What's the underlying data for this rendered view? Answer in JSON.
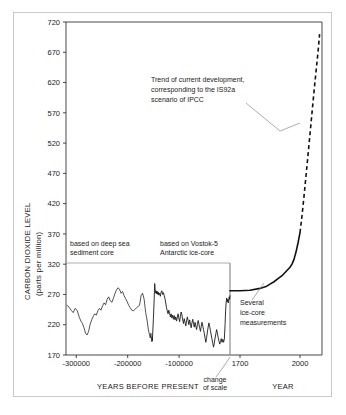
{
  "chart_data": {
    "type": "line",
    "title": "",
    "ylabel_line1": "CARBON DIOXIDE LEVEL",
    "ylabel_line2": "(parts per million)",
    "ylim": [
      170,
      720
    ],
    "yticks": [
      170,
      220,
      270,
      320,
      370,
      420,
      470,
      520,
      570,
      620,
      670,
      720
    ],
    "ytick_labels": [
      "170",
      "220",
      "270",
      "320",
      "370",
      "420",
      "470",
      "520",
      "570",
      "620",
      "670",
      "720"
    ],
    "grid": false,
    "legend": "none",
    "panels": [
      {
        "name": "paleo-panel",
        "xlabel": "YEARS BEFORE PRESENT",
        "xlim": [
          -320000,
          -1000
        ],
        "xticks": [
          -300000,
          -200000,
          -100000
        ],
        "xtick_labels": [
          "-300000",
          "-200000",
          "-100000"
        ],
        "series": [
          {
            "name": "deep-sea-sediment-core",
            "source_label_line1": "based on deep sea",
            "source_label_line2": "sediment core",
            "x_range": [
              -320000,
              -152000
            ],
            "style": "solid",
            "points": [
              [
                -318000,
                252
              ],
              [
                -314000,
                249
              ],
              [
                -310000,
                244
              ],
              [
                -306000,
                240
              ],
              [
                -302000,
                247
              ],
              [
                -298000,
                243
              ],
              [
                -294000,
                232
              ],
              [
                -291000,
                226
              ],
              [
                -288000,
                222
              ],
              [
                -285000,
                215
              ],
              [
                -282000,
                206
              ],
              [
                -279000,
                203
              ],
              [
                -276000,
                209
              ],
              [
                -273000,
                221
              ],
              [
                -270000,
                228
              ],
              [
                -267000,
                234
              ],
              [
                -264000,
                238
              ],
              [
                -261000,
                236
              ],
              [
                -258000,
                243
              ],
              [
                -255000,
                247
              ],
              [
                -252000,
                244
              ],
              [
                -249000,
                251
              ],
              [
                -246000,
                256
              ],
              [
                -243000,
                253
              ],
              [
                -240000,
                262
              ],
              [
                -237000,
                266
              ],
              [
                -234000,
                260
              ],
              [
                -231000,
                257
              ],
              [
                -228000,
                263
              ],
              [
                -225000,
                271
              ],
              [
                -222000,
                277
              ],
              [
                -219000,
                281
              ],
              [
                -216000,
                279
              ],
              [
                -213000,
                272
              ],
              [
                -210000,
                275
              ],
              [
                -207000,
                268
              ],
              [
                -204000,
                263
              ],
              [
                -201000,
                258
              ],
              [
                -198000,
                252
              ],
              [
                -195000,
                248
              ],
              [
                -192000,
                244
              ],
              [
                -189000,
                243
              ],
              [
                -186000,
                245
              ],
              [
                -183000,
                248
              ],
              [
                -180000,
                250
              ],
              [
                -177000,
                252
              ],
              [
                -174000,
                268
              ],
              [
                -171000,
                272
              ],
              [
                -168000,
                262
              ],
              [
                -165000,
                240
              ],
              [
                -162000,
                226
              ],
              [
                -160000,
                213
              ],
              [
                -158000,
                205
              ],
              [
                -156000,
                198
              ],
              [
                -155000,
                206
              ],
              [
                -154000,
                199
              ],
              [
                -153000,
                192
              ],
              [
                -152500,
                200
              ],
              [
                -152000,
                194
              ]
            ]
          },
          {
            "name": "vostok-5-antarctic-ice-core",
            "source_label_line1": "based on Vostok-5",
            "source_label_line2": "Antarctic ice-core",
            "x_range": [
              -152000,
              -1000
            ],
            "style": "solid",
            "points": [
              [
                -152000,
                194
              ],
              [
                -150000,
                230
              ],
              [
                -148500,
                262
              ],
              [
                -147500,
                288
              ],
              [
                -146500,
                278
              ],
              [
                -145500,
                272
              ],
              [
                -144500,
                276
              ],
              [
                -143500,
                271
              ],
              [
                -142500,
                275
              ],
              [
                -141500,
                270
              ],
              [
                -140500,
                274
              ],
              [
                -139500,
                269
              ],
              [
                -138000,
                272
              ],
              [
                -136500,
                267
              ],
              [
                -135000,
                274
              ],
              [
                -133500,
                276
              ],
              [
                -132000,
                270
              ],
              [
                -130500,
                273
              ],
              [
                -129000,
                268
              ],
              [
                -127500,
                263
              ],
              [
                -126000,
                256
              ],
              [
                -124500,
                248
              ],
              [
                -123000,
                243
              ],
              [
                -121500,
                238
              ],
              [
                -120000,
                244
              ],
              [
                -118500,
                239
              ],
              [
                -117000,
                233
              ],
              [
                -115500,
                238
              ],
              [
                -114000,
                231
              ],
              [
                -112500,
                236
              ],
              [
                -111000,
                229
              ],
              [
                -109500,
                235
              ],
              [
                -108000,
                228
              ],
              [
                -106500,
                233
              ],
              [
                -105000,
                226
              ],
              [
                -103500,
                232
              ],
              [
                -102000,
                238
              ],
              [
                -100500,
                231
              ],
              [
                -99000,
                225
              ],
              [
                -97500,
                234
              ],
              [
                -96000,
                241
              ],
              [
                -94500,
                236
              ],
              [
                -93000,
                228
              ],
              [
                -91500,
                222
              ],
              [
                -90000,
                230
              ],
              [
                -88500,
                224
              ],
              [
                -87000,
                218
              ],
              [
                -85500,
                226
              ],
              [
                -84000,
                233
              ],
              [
                -82500,
                227
              ],
              [
                -81000,
                220
              ],
              [
                -79500,
                228
              ],
              [
                -78000,
                221
              ],
              [
                -76500,
                215
              ],
              [
                -75000,
                223
              ],
              [
                -73500,
                229
              ],
              [
                -72000,
                222
              ],
              [
                -70500,
                216
              ],
              [
                -69000,
                224
              ],
              [
                -67500,
                218
              ],
              [
                -66000,
                212
              ],
              [
                -64500,
                220
              ],
              [
                -63000,
                227
              ],
              [
                -61500,
                221
              ],
              [
                -60000,
                215
              ],
              [
                -58500,
                209
              ],
              [
                -57000,
                217
              ],
              [
                -55500,
                224
              ],
              [
                -54000,
                218
              ],
              [
                -52500,
                212
              ],
              [
                -51000,
                206
              ],
              [
                -49500,
                198
              ],
              [
                -48000,
                191
              ],
              [
                -46500,
                199
              ],
              [
                -45000,
                208
              ],
              [
                -43500,
                216
              ],
              [
                -42000,
                223
              ],
              [
                -40500,
                217
              ],
              [
                -39000,
                210
              ],
              [
                -37500,
                203
              ],
              [
                -36000,
                196
              ],
              [
                -34500,
                189
              ],
              [
                -33000,
                183
              ],
              [
                -31500,
                190
              ],
              [
                -30000,
                198
              ],
              [
                -28500,
                205
              ],
              [
                -27000,
                212
              ],
              [
                -25500,
                206
              ],
              [
                -24000,
                199
              ],
              [
                -22500,
                193
              ],
              [
                -21000,
                188
              ],
              [
                -19500,
                192
              ],
              [
                -18000,
                197
              ],
              [
                -16500,
                191
              ],
              [
                -15000,
                196
              ],
              [
                -13500,
                191
              ],
              [
                -12000,
                196
              ],
              [
                -10500,
                222
              ],
              [
                -9500,
                244
              ],
              [
                -8500,
                256
              ],
              [
                -7500,
                264
              ],
              [
                -6500,
                258
              ],
              [
                -5500,
                262
              ],
              [
                -4500,
                256
              ],
              [
                -3500,
                261
              ],
              [
                -2500,
                266
              ],
              [
                -1800,
                262
              ],
              [
                -1000,
                268
              ]
            ]
          }
        ]
      },
      {
        "name": "modern-panel",
        "xlabel": "YEAR",
        "xlim": [
          1650,
          2110
        ],
        "xticks": [
          1700,
          2000
        ],
        "xtick_labels": [
          "1700",
          "2000"
        ],
        "series": [
          {
            "name": "instrumental-and-icecore-record",
            "style": "solid",
            "annotation_line1": "Several",
            "annotation_line2": "ice-core",
            "annotation_line3": "measurements",
            "points": [
              [
                1650,
                276
              ],
              [
                1700,
                276
              ],
              [
                1750,
                277
              ],
              [
                1800,
                280
              ],
              [
                1830,
                283
              ],
              [
                1850,
                287
              ],
              [
                1870,
                291
              ],
              [
                1890,
                296
              ],
              [
                1910,
                301
              ],
              [
                1930,
                308
              ],
              [
                1950,
                315
              ],
              [
                1960,
                320
              ],
              [
                1970,
                328
              ],
              [
                1980,
                340
              ],
              [
                1990,
                355
              ],
              [
                2000,
                372
              ]
            ]
          },
          {
            "name": "is92a-projection",
            "style": "dashed",
            "annotation_line1": "Trend of current development,",
            "annotation_line2": "corresponding to the IS92a",
            "annotation_line3": "scenario of IPCC",
            "points": [
              [
                2000,
                372
              ],
              [
                2010,
                400
              ],
              [
                2020,
                432
              ],
              [
                2030,
                466
              ],
              [
                2040,
                500
              ],
              [
                2050,
                535
              ],
              [
                2060,
                570
              ],
              [
                2070,
                605
              ],
              [
                2080,
                638
              ],
              [
                2090,
                670
              ],
              [
                2098,
                700
              ]
            ]
          }
        ]
      }
    ],
    "scale_break_note_line1": "change",
    "scale_break_note_line2": "of scale"
  }
}
